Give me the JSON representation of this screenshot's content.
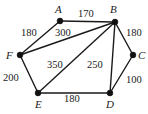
{
  "figure": {
    "kind": "weighted-undirected-graph",
    "width": 148,
    "height": 114,
    "background": "#ffffff",
    "ink_color": "#1a1a1a"
  },
  "nodes": [
    {
      "id": "A",
      "label": "A",
      "x": 60,
      "y": 21,
      "label_x": 55,
      "label_y": 4
    },
    {
      "id": "B",
      "label": "B",
      "x": 115,
      "y": 22,
      "label_x": 110,
      "label_y": 4
    },
    {
      "id": "C",
      "label": "C",
      "x": 133,
      "y": 55,
      "label_x": 138,
      "label_y": 50
    },
    {
      "id": "D",
      "label": "D",
      "x": 110,
      "y": 93,
      "label_x": 106,
      "label_y": 99
    },
    {
      "id": "E",
      "label": "E",
      "x": 38,
      "y": 93,
      "label_x": 35,
      "label_y": 99
    },
    {
      "id": "F",
      "label": "F",
      "x": 20,
      "y": 55,
      "label_x": 6,
      "label_y": 50
    }
  ],
  "edges": [
    {
      "from": "A",
      "to": "B",
      "weight": "170",
      "label_x": 78,
      "label_y": 9
    },
    {
      "from": "A",
      "to": "F",
      "weight": "180",
      "label_x": 21,
      "label_y": 28
    },
    {
      "from": "B",
      "to": "F",
      "weight": "300",
      "label_x": 55,
      "label_y": 28
    },
    {
      "from": "B",
      "to": "C",
      "weight": "180",
      "label_x": 126,
      "label_y": 28
    },
    {
      "from": "B",
      "to": "E",
      "weight": "350",
      "label_x": 47,
      "label_y": 60
    },
    {
      "from": "B",
      "to": "D",
      "weight": "250",
      "label_x": 87,
      "label_y": 60
    },
    {
      "from": "C",
      "to": "D",
      "weight": "100",
      "label_x": 126,
      "label_y": 75
    },
    {
      "from": "F",
      "to": "E",
      "weight": "200",
      "label_x": 3,
      "label_y": 73
    },
    {
      "from": "E",
      "to": "D",
      "weight": "180",
      "label_x": 64,
      "label_y": 94
    }
  ]
}
